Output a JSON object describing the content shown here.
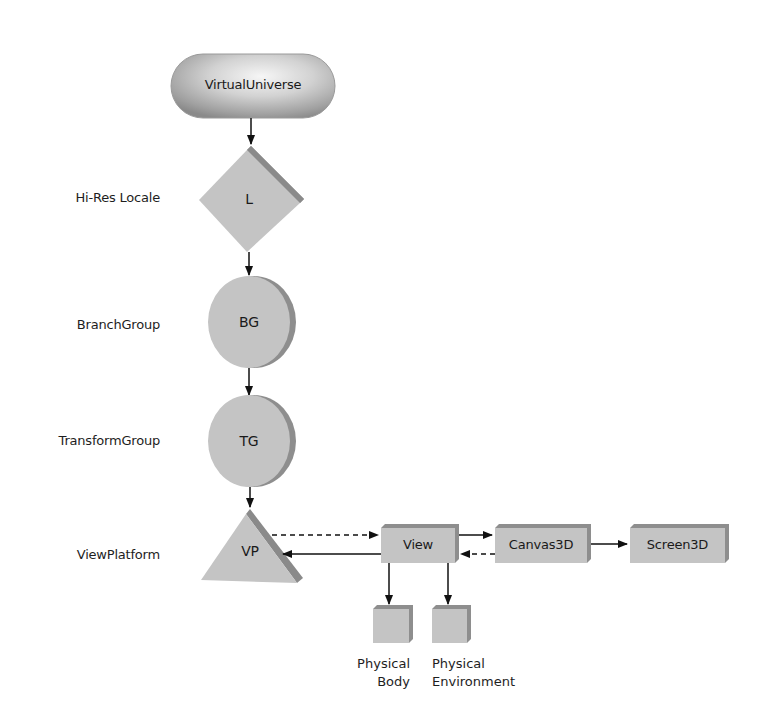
{
  "diagram": {
    "root": {
      "label": "VirtualUniverse",
      "shape": "pill"
    },
    "rows": [
      {
        "row_label": "Hi-Res Locale",
        "node_label": "L",
        "shape": "diamond"
      },
      {
        "row_label": "BranchGroup",
        "node_label": "BG",
        "shape": "circle"
      },
      {
        "row_label": "TransformGroup",
        "node_label": "TG",
        "shape": "circle"
      },
      {
        "row_label": "ViewPlatform",
        "node_label": "VP",
        "shape": "triangle"
      }
    ],
    "view_chain": [
      {
        "label": "View",
        "shape": "box"
      },
      {
        "label": "Canvas3D",
        "shape": "box"
      },
      {
        "label": "Screen3D",
        "shape": "box"
      }
    ],
    "physical": [
      {
        "line1": "Physical",
        "line2": "Body",
        "shape": "cube"
      },
      {
        "line1": "Physical",
        "line2": "Environment",
        "shape": "cube"
      }
    ],
    "edges": [
      {
        "from": "VirtualUniverse",
        "to": "L",
        "style": "solid"
      },
      {
        "from": "L",
        "to": "BG",
        "style": "solid"
      },
      {
        "from": "BG",
        "to": "TG",
        "style": "solid"
      },
      {
        "from": "TG",
        "to": "VP",
        "style": "solid"
      },
      {
        "from": "VP",
        "to": "View",
        "style": "dashed"
      },
      {
        "from": "View",
        "to": "VP",
        "style": "solid"
      },
      {
        "from": "View",
        "to": "Canvas3D",
        "style": "solid"
      },
      {
        "from": "Canvas3D",
        "to": "View",
        "style": "dashed"
      },
      {
        "from": "Canvas3D",
        "to": "Screen3D",
        "style": "solid"
      },
      {
        "from": "View",
        "to": "Physical Body",
        "style": "solid"
      },
      {
        "from": "View",
        "to": "Physical Environment",
        "style": "solid"
      }
    ],
    "colors": {
      "node_fill": "#c4c4c4",
      "node_shadow": "#8e8e8e",
      "pill_highlight": "#f2f2f2",
      "pill_edge": "#8a8a8a",
      "line": "#111111"
    }
  }
}
